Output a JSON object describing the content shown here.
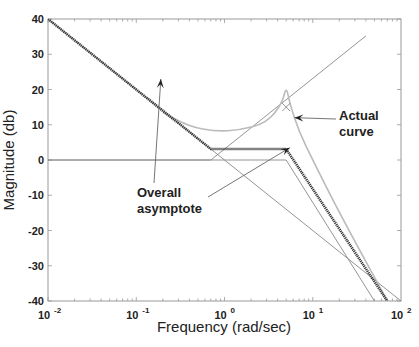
{
  "chart_data": {
    "type": "line",
    "title": "",
    "xlabel": "Frequency (rad/sec)",
    "ylabel": "Magnitude (db)",
    "xscale": "log",
    "xlim": [
      0.01,
      100
    ],
    "ylim": [
      -40,
      40
    ],
    "grid": false,
    "x_ticks": [
      {
        "value": 0.01,
        "base": "10",
        "exp": "-2"
      },
      {
        "value": 0.1,
        "base": "10",
        "exp": "-1"
      },
      {
        "value": 1,
        "base": "10",
        "exp": "0"
      },
      {
        "value": 10,
        "base": "10",
        "exp": "1"
      },
      {
        "value": 100,
        "base": "10",
        "exp": "2"
      }
    ],
    "y_ticks": [
      "40",
      "30",
      "20",
      "10",
      "0",
      "-10",
      "-20",
      "-30",
      "-40"
    ],
    "series": [
      {
        "name": "Overall asymptote",
        "style": "dotted-thick",
        "color": "#333333",
        "x": [
          0.01,
          0.7,
          5.0,
          70
        ],
        "y": [
          40,
          3.1,
          3.1,
          -40
        ]
      },
      {
        "name": "Actual curve",
        "style": "solid-light",
        "color": "#bbbbbb",
        "x": [
          0.2,
          0.4,
          0.8,
          1.5,
          3.0,
          4.5,
          5.0,
          5.5,
          7,
          10,
          20,
          70
        ],
        "y": [
          13.5,
          9.5,
          8.1,
          8.5,
          10.5,
          16,
          21,
          16,
          8,
          0,
          -15,
          -40
        ]
      },
      {
        "name": "Component asymptote: integrator (-20 dB/dec)",
        "style": "solid-thin",
        "color": "#888888",
        "x": [
          0.01,
          100
        ],
        "y": [
          40,
          -40
        ]
      },
      {
        "name": "Component asymptote: zero (+20 dB/dec from 0.7)",
        "style": "solid-thin",
        "color": "#888888",
        "x": [
          0.01,
          0.7,
          40
        ],
        "y": [
          0,
          0,
          35.2
        ]
      },
      {
        "name": "Component asymptote: second-order pole (-40 dB/dec from 5)",
        "style": "solid-thin",
        "color": "#888888",
        "x": [
          0.01,
          5,
          50
        ],
        "y": [
          0,
          0,
          -40
        ]
      }
    ],
    "annotations": [
      {
        "text": "Overall asymptote",
        "lines": [
          "Overall",
          "asymptote"
        ],
        "arrow_targets": [
          [
            0.19,
            23
          ],
          [
            5.5,
            3.5
          ]
        ]
      },
      {
        "text": "Actual curve",
        "lines": [
          "Actual",
          "curve"
        ],
        "arrow_targets": [
          [
            6.2,
            12
          ]
        ]
      },
      {
        "text": "x",
        "marker": "cross",
        "x": 5.0,
        "y": 15
      }
    ]
  }
}
